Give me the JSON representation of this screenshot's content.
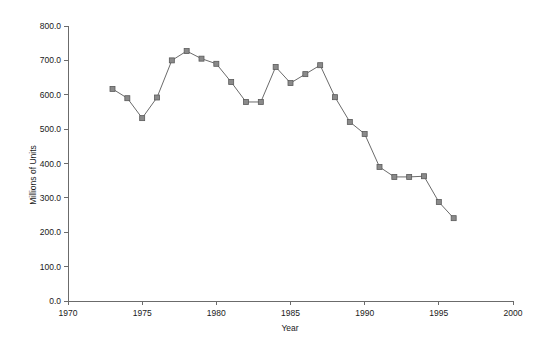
{
  "chart_data": {
    "type": "line",
    "title": "",
    "xlabel": "Year",
    "ylabel": "Millions of Units",
    "xlim": [
      1970,
      2000
    ],
    "ylim": [
      0,
      800
    ],
    "xticks": [
      1970,
      1975,
      1980,
      1985,
      1990,
      1995,
      2000
    ],
    "xtick_labels": [
      "1970",
      "1975",
      "1980",
      "1985",
      "1990",
      "1995",
      "2000"
    ],
    "yticks": [
      0,
      100,
      200,
      300,
      400,
      500,
      600,
      700,
      800
    ],
    "ytick_labels": [
      "0.0",
      "100.0",
      "200.0",
      "300.0",
      "400.0",
      "500.0",
      "600.0",
      "700.0",
      "800.0"
    ],
    "grid": false,
    "legend": "none",
    "marker": "square",
    "line_color": "#6b6b6b",
    "marker_color": "#8a8a8a",
    "x": [
      1973,
      1974,
      1975,
      1976,
      1977,
      1978,
      1979,
      1980,
      1981,
      1982,
      1983,
      1984,
      1985,
      1986,
      1987,
      1988,
      1989,
      1990,
      1991,
      1992,
      1993,
      1994,
      1995,
      1996
    ],
    "values": [
      617,
      590,
      532,
      592,
      700,
      727,
      705,
      690,
      637,
      579,
      579,
      681,
      634,
      660,
      686,
      593,
      521,
      486,
      390,
      361,
      361,
      363,
      288,
      241
    ],
    "series": [
      {
        "name": "Units",
        "values": [
          617,
          590,
          532,
          592,
          700,
          727,
          705,
          690,
          637,
          579,
          579,
          681,
          634,
          660,
          686,
          593,
          521,
          486,
          390,
          361,
          361,
          363,
          288,
          241
        ]
      }
    ]
  },
  "figure": {
    "background_color": "#ffffff",
    "axis_color": "#6b6b6b"
  }
}
